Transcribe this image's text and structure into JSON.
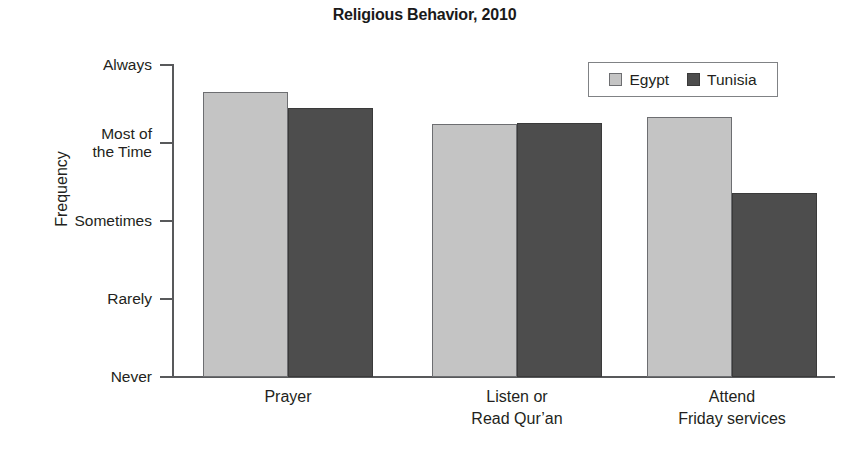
{
  "chart_data": {
    "type": "bar",
    "title": "Religious Behavior, 2010",
    "xlabel": "",
    "ylabel": "Frequency",
    "categories": [
      "Prayer",
      "Listen or\nRead Qur’an",
      "Attend\nFriday services"
    ],
    "ytick_labels": [
      "Always",
      "Most of\nthe Time",
      "Sometimes",
      "Rarely",
      "Never"
    ],
    "ytick_values": [
      4,
      3,
      2,
      1,
      0
    ],
    "ylim": [
      0,
      4
    ],
    "grid": false,
    "legend_position": "top-right",
    "series": [
      {
        "name": "Egypt",
        "color": "#c4c4c4",
        "values": [
          3.65,
          3.24,
          3.33
        ]
      },
      {
        "name": "Tunisia",
        "color": "#4d4d4d",
        "values": [
          3.45,
          3.26,
          2.36
        ]
      }
    ],
    "annotations": []
  },
  "legend": {
    "items": [
      {
        "label": "Egypt",
        "swatch": "egypt"
      },
      {
        "label": "Tunisia",
        "swatch": "tunisia"
      }
    ]
  }
}
